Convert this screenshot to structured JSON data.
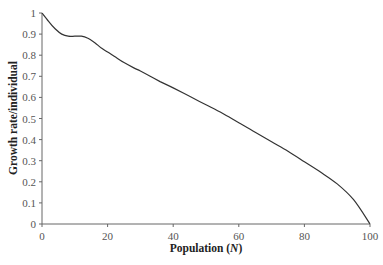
{
  "chart_data": {
    "type": "line",
    "title": "",
    "xlabel": "Population (N)",
    "xlabel_parts": {
      "main": "Population (",
      "italic": "N",
      "close": ")"
    },
    "ylabel": "Growth rate/individual",
    "xlim": [
      0,
      100
    ],
    "ylim": [
      0,
      1
    ],
    "grid": false,
    "legend": null,
    "x_ticks": [
      0,
      20,
      40,
      60,
      80,
      100
    ],
    "y_ticks": [
      0,
      0.1,
      0.2,
      0.3,
      0.4,
      0.5,
      0.6,
      0.7,
      0.8,
      0.9,
      1
    ],
    "series": [
      {
        "name": "Growth rate per individual",
        "color": "#333333",
        "x": [
          0,
          2,
          4,
          6,
          8,
          10,
          12,
          14,
          16,
          18,
          20,
          22,
          25,
          28,
          30,
          33,
          36,
          40,
          45,
          50,
          55,
          60,
          65,
          70,
          75,
          80,
          85,
          90,
          95,
          100
        ],
        "y": [
          1.0,
          0.96,
          0.925,
          0.9,
          0.89,
          0.89,
          0.89,
          0.88,
          0.86,
          0.835,
          0.815,
          0.795,
          0.765,
          0.74,
          0.725,
          0.7,
          0.675,
          0.645,
          0.605,
          0.565,
          0.525,
          0.48,
          0.435,
          0.39,
          0.345,
          0.295,
          0.245,
          0.19,
          0.115,
          0.0
        ]
      }
    ]
  }
}
